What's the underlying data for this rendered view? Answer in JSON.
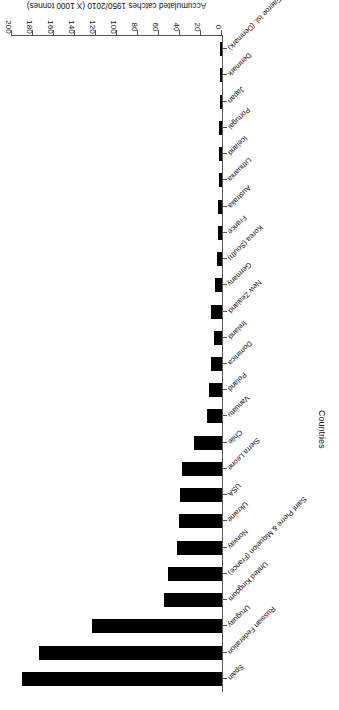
{
  "chart_data": {
    "type": "bar",
    "orientation": "horizontal",
    "title": "",
    "xlabel": "Accumulated catches 1950/2010 (X 1000 tonnes)",
    "ylabel": "Countries",
    "xlim": [
      0,
      200
    ],
    "xticks": [
      0,
      20,
      40,
      60,
      80,
      100,
      120,
      140,
      160,
      180,
      200
    ],
    "grid": false,
    "legend": null,
    "categories": [
      "Spain",
      "Russian Federation",
      "Uruguay",
      "United Kingdom",
      "Saint Pierre & Miquelon (France)",
      "Norway",
      "Ukraine",
      "USA",
      "Sierra Leone",
      "Chile",
      "Vanuatu",
      "Poland",
      "Dominica",
      "Ireland",
      "New Zealand",
      "Germany",
      "Korea (South)",
      "France",
      "Australia",
      "Lithuania",
      "Iceland",
      "Portugal",
      "Japan",
      "Denmark",
      "Faeroe Isl. (Denmark)"
    ],
    "values": [
      190,
      174,
      124,
      55,
      51,
      43,
      41,
      40,
      38,
      27,
      14,
      12,
      10,
      8,
      10,
      7,
      5,
      4,
      4,
      3,
      3,
      3,
      2,
      2,
      2
    ],
    "bar_color": "#000000"
  },
  "axis": {
    "value_title": "Accumulated catches 1950/2010 (X 1000 tonnes)",
    "category_title": "Countries"
  }
}
